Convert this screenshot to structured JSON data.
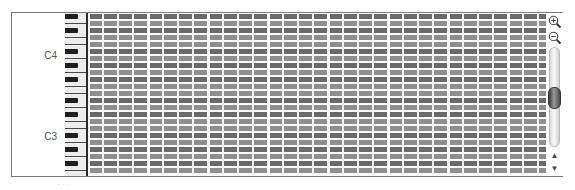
{
  "piano_roll": {
    "labels": [
      {
        "text": "C4",
        "top": 43
      },
      {
        "text": "C3",
        "top": 123
      }
    ],
    "rows": 23,
    "row_height": 7,
    "row_pattern": [
      "black",
      "white",
      "black",
      "white",
      "white",
      "black",
      "white",
      "black",
      "white",
      "black",
      "white",
      "white"
    ],
    "columns": 31,
    "column_width": 15,
    "beats_per_bar": 4,
    "colors": {
      "black_row": "#6a6a6a",
      "white_row": "#8e8e8e",
      "grid_line": "#f4f4f4",
      "black_key": "#1e1e1e",
      "white_key": "#ededed"
    }
  },
  "scrollbar": {
    "zoom_in_icon": "zoom-in-icon",
    "zoom_out_icon": "zoom-out-icon",
    "up_arrow": "▲",
    "down_arrow": "▼"
  },
  "footer": {
    "text": "· · ·"
  }
}
